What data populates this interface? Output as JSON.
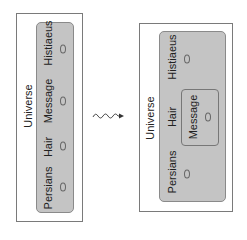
{
  "diagram": {
    "left": {
      "outer_label": "Universe",
      "items": [
        {
          "label": "Histiaeus"
        },
        {
          "label": "Message"
        },
        {
          "label": "Hair"
        },
        {
          "label": "Persians"
        }
      ]
    },
    "arrow": {
      "type": "squiggle-arrow",
      "direction": "right"
    },
    "right": {
      "outer_label": "Universe",
      "items": [
        {
          "label": "Histiaeus"
        },
        {
          "label": "Hair"
        },
        {
          "label": "Persians"
        }
      ],
      "nested": {
        "label": "Message"
      }
    },
    "colors": {
      "outer_border": "#7a7a7a",
      "inner_fill": "#c4c4c4",
      "inner_border": "#8a8a8a",
      "text": "#222222"
    }
  }
}
